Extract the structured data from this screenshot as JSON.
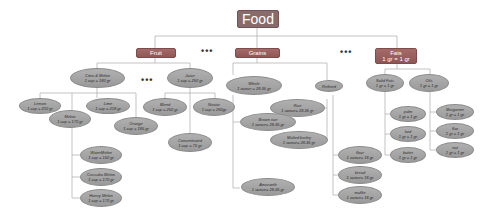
{
  "root": {
    "label": "Food"
  },
  "categories": {
    "fruit": {
      "label": "Fruit"
    },
    "grains": {
      "label": "Grains"
    },
    "fats": {
      "label": "Fats",
      "sub": "1 gr = 1 gr"
    }
  },
  "ellipsis": "•••",
  "fruit": {
    "citrus": {
      "name": "Citric & Melon",
      "val": "1 cup = 180 gr"
    },
    "juice": {
      "name": "Juice",
      "val": "1 cup = 250 gr"
    },
    "lemon": {
      "name": "Lemon",
      "val": "1 cup = 210 gr"
    },
    "lime": {
      "name": "Lime",
      "val": "1 cup = 218 gr"
    },
    "melon": {
      "name": "Melon",
      "val": "1 cup = 170 gr"
    },
    "orange": {
      "name": "Orange",
      "val": "1 cup = 185 gr"
    },
    "watermelon": {
      "name": "WaterMelon",
      "val": "1 cup = 150 gr"
    },
    "cassaba": {
      "name": "Cassaba Melon",
      "val": "1 cup = 170 gr"
    },
    "honey": {
      "name": "Honey Melon",
      "val": "1 cup = 170 gr"
    },
    "blend": {
      "name": "Blend",
      "val": "1 cup = 250 gr"
    },
    "nectar": {
      "name": "Nectar",
      "val": "1 cup = 250gr"
    },
    "concentrate": {
      "name": "Concentrated",
      "val": "1 cup = 70 gr"
    }
  },
  "grains": {
    "whole": {
      "name": "Whole",
      "val": "1 ounce = 28.35 gr"
    },
    "refined": {
      "name": "Refined"
    },
    "rice": {
      "name": "Rice",
      "val": "1 ounce= 28.35 gr"
    },
    "brownrice": {
      "name": "Brown rice",
      "val": "1 ounce= 28.35 gr"
    },
    "barley": {
      "name": "Malted barley",
      "val": "1 ounce= 28.35 gr"
    },
    "amaranth": {
      "name": "Amaranth",
      "val": "1 ounce= 28.35 gr"
    },
    "flour": {
      "name": "flour",
      "val": "1 ounce= 16 gr"
    },
    "bread": {
      "name": "bread",
      "val": "1 ounce= 16 gr"
    },
    "muffin": {
      "name": "muffin",
      "val": "1 ounce= 16 gr"
    }
  },
  "fats": {
    "solid": {
      "name": "Solid Fats",
      "val": "1 gr = 1 gr"
    },
    "oils": {
      "name": "Oils",
      "val": "1 gr = 1 gr"
    },
    "palm": {
      "name": "palm",
      "val": "1 gr = 1 gr"
    },
    "lard": {
      "name": "lard",
      "val": "1 gr = 1 gr"
    },
    "butter": {
      "name": "butter",
      "val": "1 gr = 1 gr"
    },
    "margarine": {
      "name": "Margarine",
      "val": "1 gr = 1 gr"
    },
    "flax": {
      "name": "flax",
      "val": "1 gr = 1 gr"
    },
    "nut": {
      "name": "nut",
      "val": "1 gr = 1 gr"
    }
  }
}
